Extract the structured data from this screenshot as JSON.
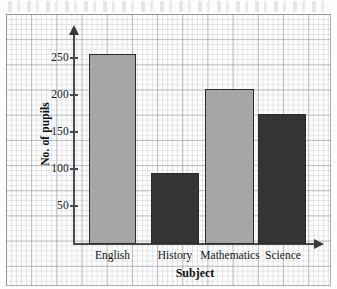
{
  "chart_data": {
    "type": "bar",
    "title": "",
    "subtitle": "",
    "xlabel": "Subject",
    "ylabel": "No. of pupils",
    "categories": [
      "English",
      "History",
      "Mathematics",
      "Science"
    ],
    "values": [
      255,
      95,
      208,
      174
    ],
    "series": [
      {
        "name": "No. of pupils",
        "values": [
          255,
          95,
          208,
          174
        ]
      }
    ],
    "bar_colors": [
      "#a6a6a6",
      "#343434",
      "#a6a6a6",
      "#343434"
    ],
    "ylim": [
      0,
      270
    ],
    "yticks": [
      50,
      100,
      150,
      200,
      250
    ],
    "ytick_labels": [
      "50",
      "100",
      "150",
      "200",
      "250"
    ],
    "grid": true,
    "grid_style": "graph-paper",
    "legend": false,
    "legend_position": "none",
    "axis_arrows": true,
    "annotations": []
  },
  "axes": {
    "y_axis_name": "y-axis",
    "x_axis_name": "x-axis"
  },
  "colors": {
    "bar_light": "#a6a6a6",
    "bar_dark": "#343434",
    "axis": "#4a4a4a",
    "grid_minor": "#afb4be",
    "grid_major": "#9696a0",
    "paper": "#fcfcfc",
    "text": "#141414"
  }
}
